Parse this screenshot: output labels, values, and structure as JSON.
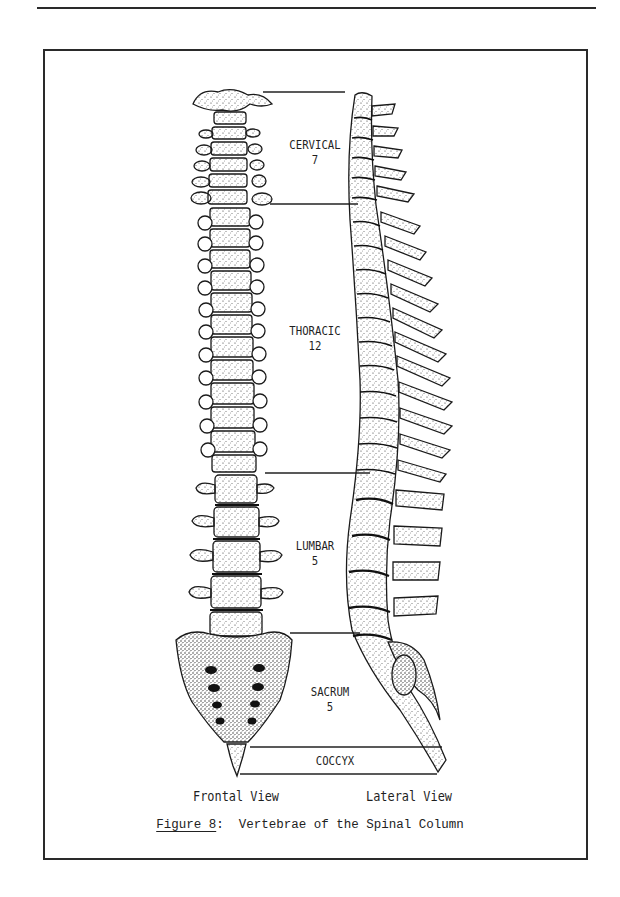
{
  "figure": {
    "number_label": "Figure 8",
    "separator": ":",
    "title": "Vertebrae of the Spinal Column"
  },
  "views": {
    "frontal": "Frontal View",
    "lateral": "Lateral View"
  },
  "regions": [
    {
      "name": "CERVICAL",
      "count": "7"
    },
    {
      "name": "THORACIC",
      "count": "12"
    },
    {
      "name": "LUMBAR",
      "count": "5"
    },
    {
      "name": "SACRUM",
      "count": "5"
    },
    {
      "name": "COCCYX",
      "count": ""
    }
  ],
  "colors": {
    "ink": "#1a1a1a",
    "paper": "#ffffff"
  }
}
